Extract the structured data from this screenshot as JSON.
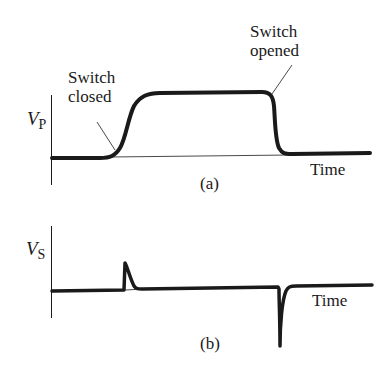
{
  "panel_a": {
    "y_axis_label": "V",
    "y_axis_subscript": "P",
    "x_axis_label": "Time",
    "caption": "(a)",
    "annotations": {
      "switch_closed_line1": "Switch",
      "switch_closed_line2": "closed",
      "switch_opened_line1": "Switch",
      "switch_opened_line2": "opened"
    }
  },
  "panel_b": {
    "y_axis_label": "V",
    "y_axis_subscript": "S",
    "x_axis_label": "Time",
    "caption": "(b)"
  },
  "colors": {
    "line": "#1a1a1a",
    "background": "#ffffff"
  }
}
